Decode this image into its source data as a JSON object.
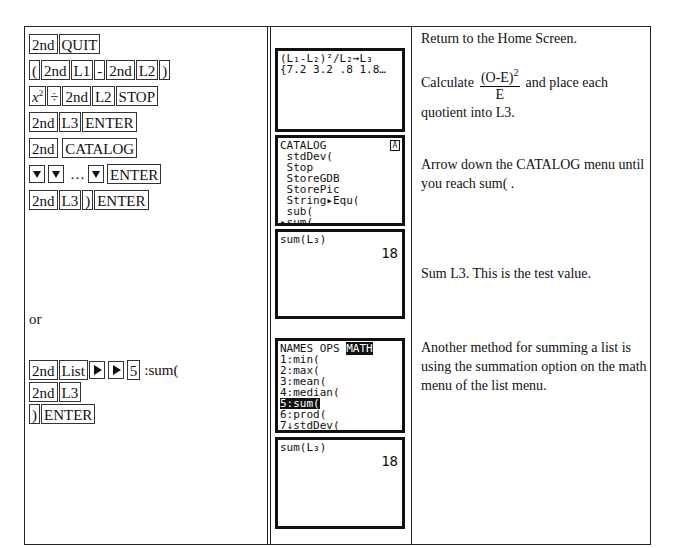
{
  "steps_column": {
    "row1": [
      "2nd",
      "QUIT"
    ],
    "row2": [
      "(",
      "2nd",
      "L1",
      "-",
      "2nd",
      "L2",
      ")"
    ],
    "row3": {
      "x": "x",
      "sup": "2",
      "div": "÷",
      "k2": "2nd",
      "k3": "L2",
      "k4": "STOP"
    },
    "row4": [
      "2nd",
      "L3",
      "ENTER"
    ],
    "row5": [
      "2nd",
      "CATALOG"
    ],
    "row6": {
      "ellipsis": "…",
      "enter": "ENTER",
      "arrow_icon": "down-arrow-key"
    },
    "row7": [
      "2nd",
      "L3",
      ")",
      "ENTER"
    ],
    "or_label": "or",
    "row8": {
      "k1": "2nd",
      "k2": "List",
      "k3": "5",
      "suffix": ":sum(",
      "arrow_icon": "right-arrow-key"
    },
    "row9": [
      "2nd",
      "L3"
    ],
    "row10": [
      ")",
      "ENTER"
    ]
  },
  "screens": {
    "screen1": {
      "lines": [
        "(L₁-L₂)²/L₂→L₃",
        "{7.2 3.2 .8 1.8…"
      ]
    },
    "screen2": {
      "badge": "A",
      "lines": [
        "CATALOG",
        " stdDev(",
        " Stop",
        " StoreGDB",
        " StorePic",
        " String▸Equ(",
        " sub(",
        "▸sum("
      ]
    },
    "screen3": {
      "lines": [
        "sum(L₃)"
      ],
      "result": "18"
    },
    "screen4": {
      "menu": {
        "tab1": "NAMES",
        "tab2": "OPS",
        "tab3": "MATH"
      },
      "lines": [
        "1:min(",
        "2:max(",
        "3:mean(",
        "4:median(",
        "5:sum(",
        "6:prod(",
        "7↓stdDev("
      ]
    },
    "screen5": {
      "lines": [
        "sum(L₃)"
      ],
      "result": "18"
    }
  },
  "descriptions": {
    "d1": "Return to the Home Screen.",
    "d2_pre": "Calculate",
    "d2_num": "(O-E)",
    "d2_sup": "2",
    "d2_den": "E",
    "d2_post": "and place each",
    "d2_line2": "quotient into L3.",
    "d3": "Arrow down the CATALOG menu until you reach  sum( .",
    "d4": "Sum L3.  This is the test value.",
    "d5": "Another method for summing a list is using the summation option on the math menu of the list menu."
  }
}
